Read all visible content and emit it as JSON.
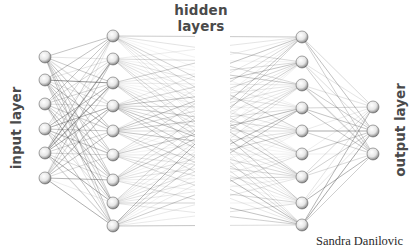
{
  "labels": {
    "hidden": "hidden layers",
    "input": "input layer",
    "output": "output layer",
    "credit": "Sandra Danilovic"
  },
  "layers": [
    {
      "name": "input",
      "x": 45,
      "nodes_y": [
        57,
        80,
        104,
        129,
        153,
        178
      ]
    },
    {
      "name": "hidden-1",
      "x": 113,
      "nodes_y": [
        36,
        59,
        83,
        106,
        131,
        155,
        180,
        203,
        226
      ]
    },
    {
      "name": "hidden-2",
      "x": 302,
      "nodes_y": [
        37,
        62,
        85,
        108,
        131,
        154,
        177,
        203,
        225
      ]
    },
    {
      "name": "output",
      "x": 373,
      "nodes_y": [
        107,
        131,
        154
      ]
    }
  ],
  "style": {
    "node_radius": 6,
    "line_color": "#555555",
    "text_color": "#4a4a4a",
    "fade_gap": [
      195,
      230
    ]
  }
}
